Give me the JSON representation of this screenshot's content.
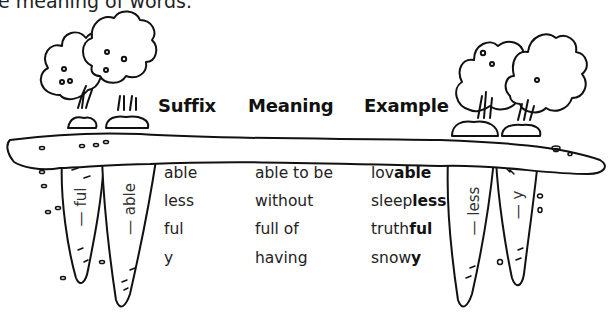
{
  "intro_text_fragment": "e meaning of words.",
  "table": {
    "headers": {
      "suffix": "Suffix",
      "meaning": "Meaning",
      "example": "Example"
    },
    "rows": [
      {
        "suffix": "able",
        "meaning": "able to be",
        "example_root": "lov",
        "example_suffix": "able"
      },
      {
        "suffix": "less",
        "meaning": "without",
        "example_root": "sleep",
        "example_suffix": "less"
      },
      {
        "suffix": "ful",
        "meaning": "full of",
        "example_root": "truth",
        "example_suffix": "ful"
      },
      {
        "suffix": "y",
        "meaning": "having",
        "example_root": "snow",
        "example_suffix": "y"
      }
    ]
  },
  "carrots": {
    "left": [
      {
        "label": "— ful"
      },
      {
        "label": "— able"
      }
    ],
    "right": [
      {
        "label": "— less"
      },
      {
        "label": "— y"
      }
    ]
  },
  "colors": {
    "ink": "#111111",
    "background": "#ffffff"
  }
}
